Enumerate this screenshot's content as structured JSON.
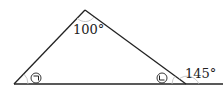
{
  "diagram": {
    "type": "triangle-exterior-angle",
    "apex_angle_label": "100°",
    "exterior_angle_label": "145°",
    "left_angle_marker": "㉠",
    "right_angle_marker": "㉡",
    "line_color": "#222222",
    "arc_color": "#bbbbbb"
  }
}
